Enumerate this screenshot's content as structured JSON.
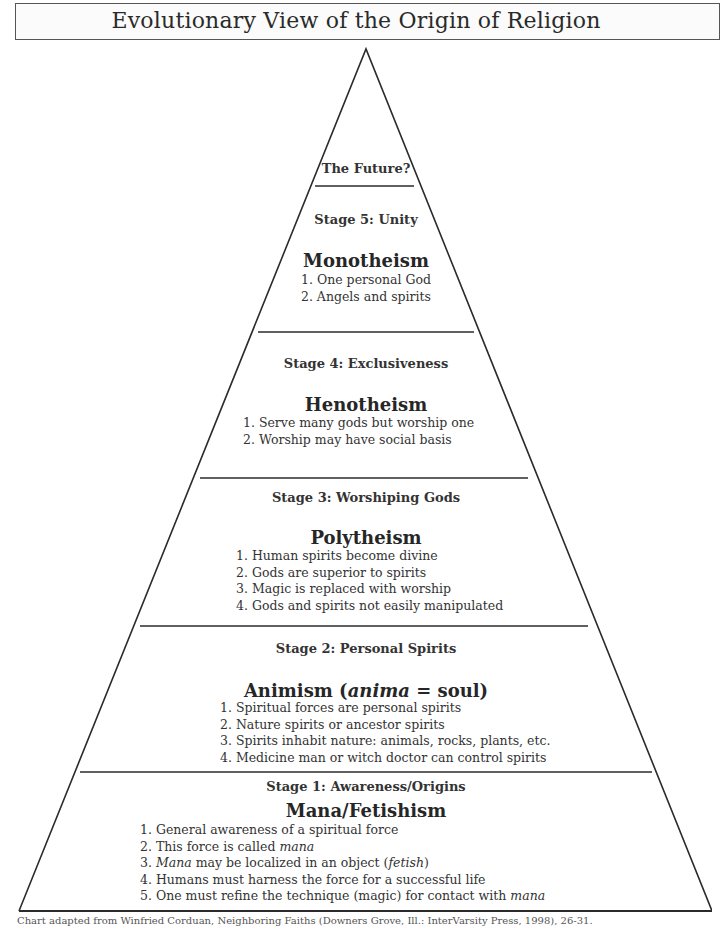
{
  "title": "Evolutionary View of the Origin of Religion",
  "pyramid": {
    "top": {
      "label": "The Future?"
    },
    "stages": [
      {
        "stage": "Stage 5: Unity",
        "heading": "Monotheism",
        "items": [
          "1. One personal God",
          "2. Angels and spirits"
        ]
      },
      {
        "stage": "Stage  4: Exclusiveness",
        "heading": "Henotheism",
        "items": [
          "1. Serve many gods but worship one",
          "2. Worship may have social basis"
        ]
      },
      {
        "stage": "Stage 3: Worshiping Gods",
        "heading": "Polytheism",
        "items": [
          "1. Human spirits become divine",
          "2. Gods are superior to spirits",
          "3. Magic is replaced with worship",
          "4. Gods and spirits not easily manipulated"
        ]
      },
      {
        "stage": "Stage 2: Personal Spirits",
        "heading_prefix": "Animism (",
        "heading_italic": "anima",
        "heading_suffix": " = soul)",
        "items": [
          "1. Spiritual forces are personal spirits",
          "2. Nature spirits or ancestor spirits",
          "3. Spirits inhabit nature: animals, rocks, plants, etc.",
          "4. Medicine man or witch doctor can control spirits"
        ]
      },
      {
        "stage": "Stage 1: Awareness/Origins",
        "heading": "Mana/Fetishism",
        "items": [
          {
            "text": "1. General awareness of a spiritual force"
          },
          {
            "pre": "2. This force is called ",
            "em": "mana",
            "post": ""
          },
          {
            "pre": "3. ",
            "em": "Mana",
            "post": " may be localized in an object (",
            "em2": "fetish",
            "post2": ")"
          },
          {
            "text": "4. Humans must harness the force for a successful life"
          },
          {
            "pre": "5. One must refine the technique (magic) for contact with ",
            "em": "mana",
            "post": ""
          }
        ]
      }
    ]
  },
  "footer": "Chart adapted from Winfried Corduan, Neighboring Faiths (Downers Grove, Ill.: InterVarsity Press, 1998), 26-31.",
  "colors": {
    "line": "#2b2b2b",
    "text": "#2a2a2a",
    "background": "#ffffff"
  }
}
